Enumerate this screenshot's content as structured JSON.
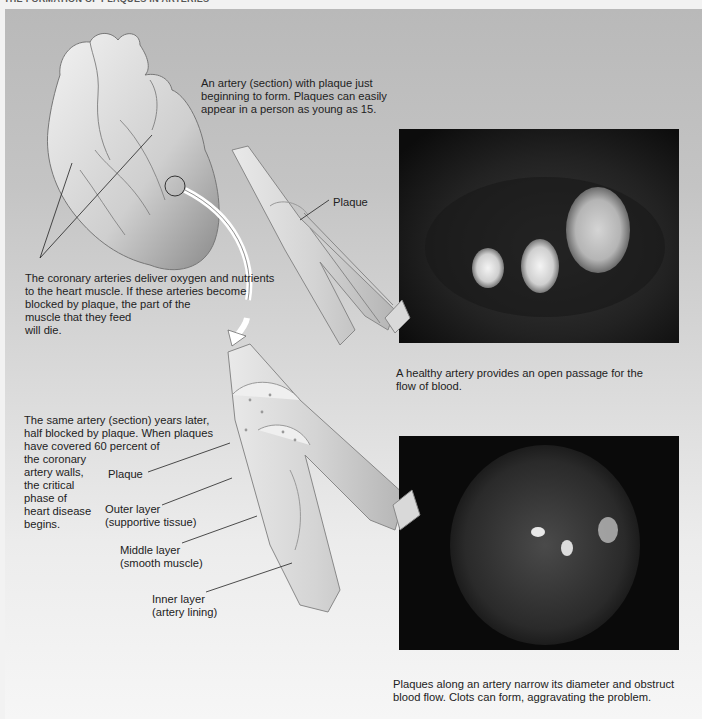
{
  "header": {
    "title": "THE FORMATION OF PLAQUES IN ARTERIES"
  },
  "captions": {
    "top_artery": [
      "An artery (section) with plaque just",
      "beginning to form. Plaques can easily",
      "appear in a person as young as 15."
    ],
    "coronary": [
      "The coronary arteries deliver oxygen and nutrients",
      "to the heart muscle. If these arteries become",
      "blocked by plaque, the part of the",
      "muscle that they feed",
      "will die."
    ],
    "same_artery": [
      "The same artery (section) years later,",
      "half blocked by plaque. When plaques",
      "have covered 60 percent of",
      "the coronary",
      "artery walls,",
      "the critical",
      "phase of",
      "heart disease",
      "begins."
    ],
    "healthy_photo": [
      "A healthy artery provides an open passage for the",
      "flow of blood."
    ],
    "plaque_photo": [
      "Plaques along an artery narrow its diameter and obstruct",
      "blood flow. Clots can form, aggravating the problem."
    ]
  },
  "labels": {
    "plaque_top": "Plaque",
    "plaque_bottom": "Plaque",
    "outer_layer": [
      "Outer layer",
      "(supportive tissue)"
    ],
    "middle_layer": [
      "Middle layer",
      "(smooth muscle)"
    ],
    "inner_layer": [
      "Inner layer",
      "(artery lining)"
    ]
  },
  "colors": {
    "panel_top": "#b9b9b9",
    "panel_bottom": "#f6f6f6",
    "photo_bg": "#111111",
    "text": "#222222"
  }
}
